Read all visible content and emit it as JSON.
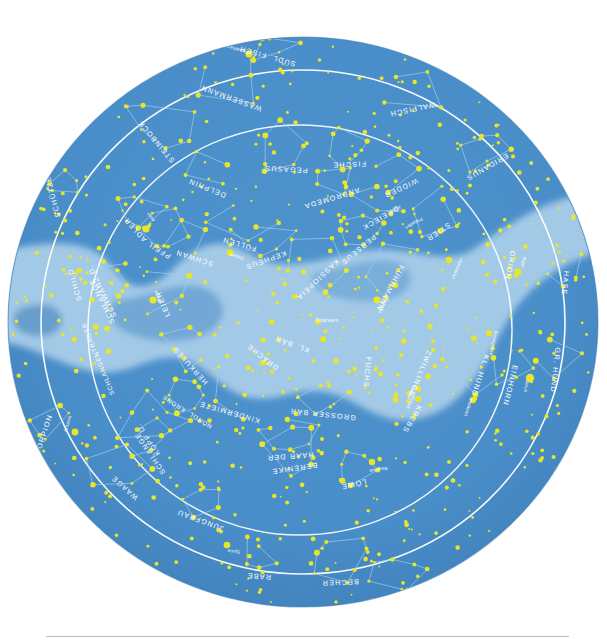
{
  "page": {
    "faint_header": "· ·· ·  ···",
    "background_color": "#ffffff",
    "divider_color": "#b9bcc1"
  },
  "sky": {
    "disc_color": "#4a8ec9",
    "disc_edge_color": "#3b7cb5",
    "milkyway_color": "#a9cde8",
    "milkyway_dark_color": "#3f82bd",
    "star_color": "#e8e628",
    "line_color": "#9fd0ee",
    "circle_color": "#ffffff",
    "label_color": "#ffffff",
    "center_x": 303,
    "center_y": 322,
    "radius_x": 295,
    "radius_y": 285
  },
  "circles": [
    {
      "name": "outer-declination-circle",
      "rx": 262,
      "ry": 252
    },
    {
      "name": "ecliptic-circle",
      "rx": 212,
      "ry": 205,
      "cx": 300,
      "cy": 330
    }
  ],
  "constellations": [
    {
      "name": "SÜDL. FISCH",
      "x": 268,
      "y": 54,
      "rot": 196
    },
    {
      "name": "WASSERMANN",
      "x": 232,
      "y": 96,
      "rot": 200
    },
    {
      "name": "STEINBOCK",
      "x": 158,
      "y": 140,
      "rot": 230
    },
    {
      "name": "SCHÜTZE",
      "x": 55,
      "y": 196,
      "rot": 256
    },
    {
      "name": "DELPHIN",
      "x": 208,
      "y": 186,
      "rot": 202
    },
    {
      "name": "PEGASUS",
      "x": 286,
      "y": 167,
      "rot": 183
    },
    {
      "name": "FISCHE",
      "x": 349,
      "y": 162,
      "rot": 178
    },
    {
      "name": "WALFISCH",
      "x": 412,
      "y": 107,
      "rot": 168
    },
    {
      "name": "ANDROMEDA",
      "x": 331,
      "y": 196,
      "rot": 163
    },
    {
      "name": "WIDDER",
      "x": 400,
      "y": 186,
      "rot": 155
    },
    {
      "name": "DREIECK",
      "x": 379,
      "y": 216,
      "rot": 150
    },
    {
      "name": "PERSEUS",
      "x": 357,
      "y": 248,
      "rot": 140
    },
    {
      "name": "STIER",
      "x": 437,
      "y": 230,
      "rot": 146
    },
    {
      "name": "ERIDANUS",
      "x": 486,
      "y": 165,
      "rot": 150
    },
    {
      "name": "FUHRMANN",
      "x": 388,
      "y": 287,
      "rot": 118
    },
    {
      "name": "KASSIOPEIA",
      "x": 316,
      "y": 278,
      "rot": 136
    },
    {
      "name": "KEPHEUS",
      "x": 265,
      "y": 258,
      "rot": 160
    },
    {
      "name": "ADLER",
      "x": 137,
      "y": 228,
      "rot": 228
    },
    {
      "name": "PFEIL",
      "x": 160,
      "y": 248,
      "rot": 212
    },
    {
      "name": "FÜLLEN",
      "x": 240,
      "y": 242,
      "rot": 196
    },
    {
      "name": "SCHWAN",
      "x": 195,
      "y": 256,
      "rot": 198
    },
    {
      "name": "LEIER",
      "x": 165,
      "y": 303,
      "rot": 247
    },
    {
      "name": "SCHILD",
      "x": 77,
      "y": 284,
      "rot": 254
    },
    {
      "name": "SCHWANZ D.",
      "x": 104,
      "y": 290,
      "rot": 244
    },
    {
      "name": "SCHLANGE",
      "x": 104,
      "y": 300,
      "rot": 244
    },
    {
      "name": "SCHLANGENTRÄGER",
      "x": 100,
      "y": 358,
      "rot": 248
    },
    {
      "name": "HERKULES",
      "x": 192,
      "y": 364,
      "rot": 228
    },
    {
      "name": "NÖRDL. KRONE",
      "x": 188,
      "y": 410,
      "rot": 212
    },
    {
      "name": "KINDERMIETE",
      "x": 230,
      "y": 410,
      "rot": 196
    },
    {
      "name": "DRACHE",
      "x": 264,
      "y": 355,
      "rot": 218
    },
    {
      "name": "KL. BÄR",
      "x": 293,
      "y": 342,
      "rot": 200
    },
    {
      "name": "GROSSER BÄR",
      "x": 323,
      "y": 412,
      "rot": 186
    },
    {
      "name": "FUCHS",
      "x": 365,
      "y": 372,
      "rot": 96
    },
    {
      "name": "ZWILLINGE",
      "x": 418,
      "y": 373,
      "rot": 112
    },
    {
      "name": "KREBS",
      "x": 410,
      "y": 418,
      "rot": 120
    },
    {
      "name": "KL. HUND",
      "x": 478,
      "y": 375,
      "rot": 108
    },
    {
      "name": "EINHORN",
      "x": 508,
      "y": 385,
      "rot": 104
    },
    {
      "name": "GR. HUND",
      "x": 553,
      "y": 370,
      "rot": 96
    },
    {
      "name": "HASE",
      "x": 563,
      "y": 283,
      "rot": 96
    },
    {
      "name": "ORION",
      "x": 508,
      "y": 265,
      "rot": 100
    },
    {
      "name": "HAAR DER",
      "x": 290,
      "y": 454,
      "rot": 176
    },
    {
      "name": "BERENIKE",
      "x": 294,
      "y": 466,
      "rot": 172
    },
    {
      "name": "LÖWE",
      "x": 353,
      "y": 482,
      "rot": 168
    },
    {
      "name": "SKORPION",
      "x": 45,
      "y": 438,
      "rot": 288
    },
    {
      "name": "KOPF D.",
      "x": 150,
      "y": 438,
      "rot": 236
    },
    {
      "name": "SCHLANGE",
      "x": 152,
      "y": 452,
      "rot": 236
    },
    {
      "name": "WAAGE",
      "x": 126,
      "y": 486,
      "rot": 222
    },
    {
      "name": "JUNGFRAU",
      "x": 201,
      "y": 518,
      "rot": 200
    },
    {
      "name": "RABE",
      "x": 259,
      "y": 574,
      "rot": 184
    },
    {
      "name": "BECHER",
      "x": 340,
      "y": 580,
      "rot": 178
    },
    {
      "name": "WASSERSCHLANGE",
      "x": 405,
      "y": 594,
      "rot": 172
    }
  ],
  "named_stars": [
    {
      "name": "Fomalhaut",
      "x": 238,
      "y": 48,
      "rot": 196,
      "px": 249,
      "py": 54,
      "mag": 3.6
    },
    {
      "name": "Atair",
      "x": 152,
      "y": 216,
      "rot": 232,
      "px": 146,
      "py": 229,
      "mag": 3.6
    },
    {
      "name": "Deneb",
      "x": 237,
      "y": 255,
      "rot": 198,
      "px": 230,
      "py": 253,
      "mag": 3.4
    },
    {
      "name": "Wega",
      "x": 159,
      "y": 296,
      "rot": 246,
      "px": 153,
      "py": 300,
      "mag": 3.6
    },
    {
      "name": "Polarstern",
      "x": 327,
      "y": 322,
      "rot": 0,
      "px": 318,
      "py": 322,
      "mag": 2.8
    },
    {
      "name": "Algol",
      "x": 395,
      "y": 208,
      "rot": 150,
      "px": 391,
      "py": 214,
      "mag": 2.4
    },
    {
      "name": "Plejaden",
      "x": 413,
      "y": 222,
      "rot": 150,
      "px": 420,
      "py": 232,
      "mag": 2.0
    },
    {
      "name": "Aldebaran",
      "x": 456,
      "y": 268,
      "rot": 112,
      "px": 449,
      "py": 260,
      "mag": 3.3
    },
    {
      "name": "Kapella",
      "x": 382,
      "y": 305,
      "rot": 118,
      "px": 377,
      "py": 300,
      "mag": 3.4
    },
    {
      "name": "Rigel",
      "x": 522,
      "y": 262,
      "rot": 100,
      "px": 518,
      "py": 272,
      "mag": 3.4
    },
    {
      "name": "Beteigeuze",
      "x": 492,
      "y": 343,
      "rot": 102,
      "px": 489,
      "py": 333,
      "mag": 3.1
    },
    {
      "name": "Castor",
      "x": 410,
      "y": 392,
      "rot": 114,
      "px": 418,
      "py": 388,
      "mag": 2.6
    },
    {
      "name": "Pollux",
      "x": 409,
      "y": 402,
      "rot": 114,
      "px": 418,
      "py": 399,
      "mag": 3.0
    },
    {
      "name": "Prokyon",
      "x": 467,
      "y": 407,
      "rot": 108,
      "px": 473,
      "py": 400,
      "mag": 3.2
    },
    {
      "name": "Sirius",
      "x": 525,
      "y": 386,
      "rot": 98,
      "px": 530,
      "py": 378,
      "mag": 4.2
    },
    {
      "name": "Regulus",
      "x": 378,
      "y": 468,
      "rot": 170,
      "px": 372,
      "py": 462,
      "mag": 3.2
    },
    {
      "name": "Spica",
      "x": 234,
      "y": 550,
      "rot": 186,
      "px": 227,
      "py": 545,
      "mag": 3.3
    },
    {
      "name": "Antares",
      "x": 69,
      "y": 424,
      "rot": 286,
      "px": 75,
      "py": 432,
      "mag": 3.4
    }
  ],
  "chart_data": {
    "type": "scatter",
    "projection": "polar / stereographic north",
    "star_count_approx": 420,
    "constellation_count": 48,
    "named_star_count": 18
  }
}
